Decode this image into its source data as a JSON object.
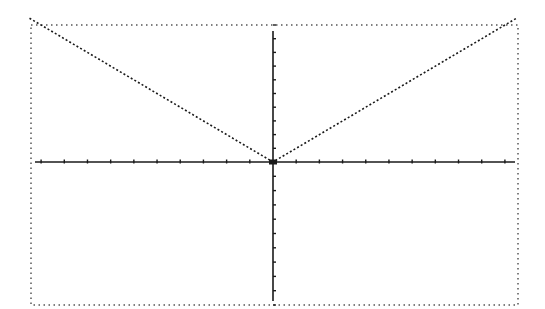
{
  "screen": {
    "type": "graphing-calculator-display",
    "border_style": "dotted",
    "colors": {
      "background": "#ffffff",
      "ink": "#1a1a1a",
      "border": "#555555"
    }
  },
  "chart_data": {
    "type": "line",
    "title": "",
    "function": "y = |x|",
    "xlabel": "",
    "ylabel": "",
    "xlim": [
      -10.5,
      10.5
    ],
    "ylim": [
      -10,
      10
    ],
    "x_ticks": [
      -10,
      -9,
      -8,
      -7,
      -6,
      -5,
      -4,
      -3,
      -2,
      -1,
      1,
      2,
      3,
      4,
      5,
      6,
      7,
      8,
      9,
      10
    ],
    "y_ticks": [
      -10,
      -9,
      -8,
      -7,
      -6,
      -5,
      -4,
      -3,
      -2,
      -1,
      1,
      2,
      3,
      4,
      5,
      6,
      7,
      8,
      9,
      10
    ],
    "tick_labels_shown": false,
    "grid": false,
    "legend": null,
    "series": [
      {
        "name": "y=|x|",
        "style": "dotted",
        "x": [
          -10.5,
          -5,
          0,
          5,
          10.5
        ],
        "y": [
          10.5,
          5,
          0,
          5,
          10.5
        ]
      }
    ]
  }
}
